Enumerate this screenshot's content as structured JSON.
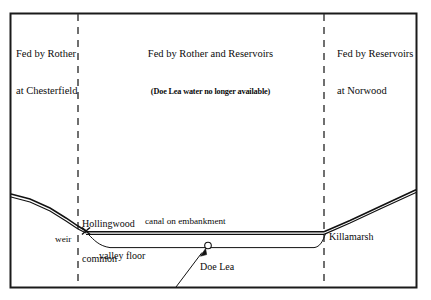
{
  "figure": {
    "type": "cross-section-diagram",
    "title_present": false,
    "frame": {
      "x": 10,
      "y": 13,
      "width": 407,
      "height": 275,
      "stroke": "#1a1a1a"
    }
  },
  "colors": {
    "ink": "#0b0b0b",
    "frame": "#1a1a1a",
    "terrain": "#111111",
    "dashed": "#333333",
    "background": "#ffffff"
  },
  "zones": [
    {
      "id": "left",
      "lines": [
        "Fed by Rother",
        "at Chesterfield"
      ],
      "subtitle": null,
      "align": "left"
    },
    {
      "id": "center",
      "lines": [
        "Fed by Rother and Reservoirs"
      ],
      "subtitle": "(Doe Lea water no longer available)",
      "align": "center"
    },
    {
      "id": "right",
      "lines": [
        "Fed by Reservoirs",
        "at Norwood"
      ],
      "subtitle": null,
      "align": "left"
    }
  ],
  "dividers": [
    {
      "id": "divider-left",
      "x": 78,
      "style": "dashed"
    },
    {
      "id": "divider-right",
      "x": 324,
      "style": "dashed"
    }
  ],
  "map_labels": [
    {
      "id": "hollingwood",
      "line1": "Hollingwood",
      "line2": "common",
      "x": 82,
      "y": 196
    },
    {
      "id": "weir",
      "text": "weir",
      "x": 56,
      "y": 236
    },
    {
      "id": "canal",
      "text": "canal on embankment",
      "x": 145,
      "y": 218
    },
    {
      "id": "valley-floor",
      "text": "valley floor",
      "x": 99,
      "y": 252
    },
    {
      "id": "doe-lea",
      "text": "Doe Lea",
      "x": 199,
      "y": 262
    },
    {
      "id": "killamarsh",
      "text": "Killamarsh",
      "x": 328,
      "y": 233
    }
  ],
  "markers": [
    {
      "id": "weir-marker",
      "shape": "cross-x",
      "x": 86,
      "y": 231
    },
    {
      "id": "doe-lea-marker",
      "shape": "circle",
      "x": 208,
      "y": 245,
      "r": 3
    }
  ],
  "paths": {
    "hillside_left": "M 11,194 L 30,199 L 50,208 L 66,218 L 78,226 L 86,231",
    "hillside_left_shadow": "M 11,197 L 30,202 L 50,211 L 66,221 L 78,229 L 86,233",
    "canal": "M 86,232 L 324,232",
    "canal_shadow": "M 86,234 L 324,234",
    "hillside_right": "M 324,232 L 350,221 L 380,207 L 416,190",
    "hillside_right_shadow": "M 324,234 L 350,223 L 380,209 L 416,192",
    "valley_floor_left_drop": "M 88,233 L 96,240 L 104,246 L 112,248 L 180,248",
    "valley_floor": "M 112,248 L 316,248",
    "valley_floor_right_rise": "M 316,248 L 321,243 L 324,236 L 326,232",
    "doe_lea_pointer": "M 176,288 L 203,251",
    "doe_lea_arrowhead": "M 200,247 L 208,252 L 203,253"
  }
}
